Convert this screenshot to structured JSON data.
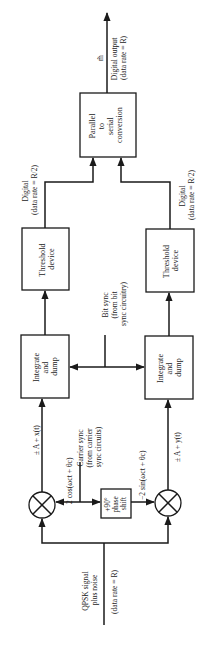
{
  "blocks": {
    "parallel_to_serial": {
      "lines": [
        "Parallel",
        "to",
        "serial",
        "conversion"
      ]
    },
    "threshold_top": {
      "lines": [
        "Threshold",
        "device"
      ]
    },
    "threshold_bottom": {
      "lines": [
        "Threshold",
        "device"
      ]
    },
    "integrate_top": {
      "lines": [
        "Integrate",
        "and",
        "dump"
      ]
    },
    "integrate_bottom": {
      "lines": [
        "Integrate",
        "and",
        "dump"
      ]
    },
    "phase_shift": {
      "lines": [
        "+90°",
        "phase",
        "shift"
      ]
    },
    "multiplier_top": {
      "symbol": "⊗"
    },
    "multiplier_bottom": {
      "symbol": "⊗"
    }
  },
  "labels": {
    "output_symbol": "m̃",
    "digital_output": [
      "Digital output",
      "(data rate = R)"
    ],
    "digital_top": [
      "Digital",
      "(data rate = R/2)"
    ],
    "digital_bottom": [
      "Digital",
      "(data rate = R/2)"
    ],
    "bit_sync": [
      "Bit sync",
      "(from bit",
      "sync circuitry)"
    ],
    "signal_x": "± A + x(t)",
    "signal_y": "± A + y(t)",
    "carrier_cos": "2 cos(ωct + θc)",
    "carrier_sin": "−2 sin(ωct + θc)",
    "carrier_sync": [
      "Carrier sync",
      "(from carrier",
      "sync circuits)"
    ],
    "input": [
      "QPSK signal",
      "plus noise"
    ],
    "input_rate": "(data rate = R)"
  },
  "colors": {
    "ink": "#1a1a1a",
    "background": "#ffffff"
  }
}
